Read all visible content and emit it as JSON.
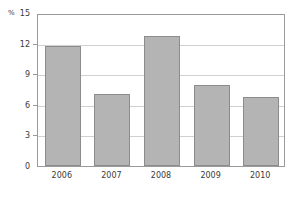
{
  "chart_data": {
    "type": "bar",
    "title": "",
    "xlabel": "",
    "ylabel": "%",
    "unit_label": "%",
    "categories": [
      "2006",
      "2007",
      "2008",
      "2009",
      "2010"
    ],
    "values": [
      11.8,
      7.1,
      12.7,
      7.9,
      6.8
    ],
    "ylim": [
      0,
      15
    ],
    "yticks": [
      0,
      3,
      6,
      9,
      12,
      15
    ],
    "ytick_labels": [
      "0",
      "3",
      "6",
      "9",
      "12",
      "15"
    ],
    "grid": true,
    "legend": "none",
    "bar_color": "#b4b4b4",
    "bar_border_color": "#8c8c8c",
    "grid_color": "#d0d0d0",
    "axis_color": "#9a9a9a",
    "background": "#ffffff"
  }
}
